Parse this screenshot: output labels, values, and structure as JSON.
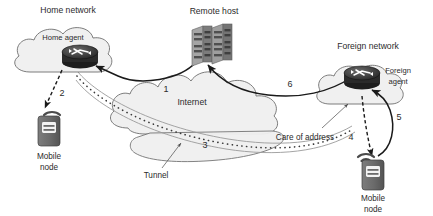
{
  "diagram": {
    "background_color": "#ffffff",
    "labels": {
      "home_network": "Home network",
      "home_agent": "Home agent",
      "remote_host": "Remote host",
      "foreign_network": "Foreign network",
      "foreign_agent_line1": "Foreign",
      "foreign_agent_line2": "agent",
      "internet": "Internet",
      "tunnel": "Tunnel",
      "care_of_address": "Care of address",
      "mobile_node_left_line1": "Mobile",
      "mobile_node_left_line2": "node",
      "mobile_node_right_line1": "Mobile",
      "mobile_node_right_line2": "node"
    },
    "step_numbers": {
      "one": "1",
      "two": "2",
      "three": "3",
      "four": "4",
      "five": "5",
      "six": "6"
    },
    "colors": {
      "cloud_fill": "#f0f0f0",
      "cloud_stroke": "#6e6e6e",
      "line": "#1a1a1a",
      "text": "#2b2b2b",
      "device_body": "#6a6a6a",
      "router_body": "#3c3c3c"
    },
    "icons": {
      "home_agent_router": "router-icon",
      "foreign_agent_router": "router-icon",
      "remote_host_server": "server-icon",
      "mobile_node_left": "mobile-device-icon",
      "mobile_node_right": "mobile-device-icon",
      "wifi_left": "wifi-signal-icon",
      "wifi_right": "wifi-signal-icon"
    }
  }
}
